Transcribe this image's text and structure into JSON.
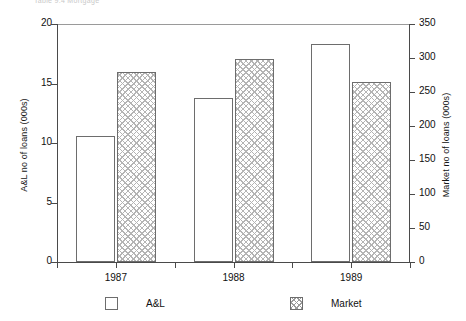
{
  "caption": {
    "text": "Table 9.4  Mortgage"
  },
  "legend": {
    "entries": [
      {
        "label": "A&L",
        "style": "plain"
      },
      {
        "label": "Market",
        "style": "hatched"
      }
    ]
  },
  "axes": {
    "left_title": "A&L no of loans (000s)",
    "right_title": "Market no of loans (000s)",
    "left_ticks": [
      "0",
      "5",
      "10",
      "15",
      "20"
    ],
    "right_ticks": [
      "0",
      "50",
      "100",
      "150",
      "200",
      "250",
      "300",
      "350"
    ]
  },
  "chart_data": {
    "type": "bar",
    "title": "",
    "subtitle": "",
    "xlabel": "",
    "ylabel": "A&L no of loans (000s)",
    "y2label": "Market no of loans (000s)",
    "categories": [
      "1987",
      "1988",
      "1989"
    ],
    "series": [
      {
        "name": "A&L",
        "axis": "left",
        "unit": "000s",
        "values": [
          10.6,
          13.8,
          18.3
        ]
      },
      {
        "name": "Market",
        "axis": "right",
        "unit": "000s",
        "values": [
          265,
          265,
          265
        ]
      }
    ],
    "series_market_left_equivalent": [
      16.0,
      17.1,
      15.1
    ],
    "ylim": [
      0,
      20
    ],
    "y2lim": [
      0,
      350
    ],
    "ytick_step": 5,
    "y2tick_step": 50,
    "grid": false,
    "legend_position": "bottom",
    "colors": {
      "al_fill": "#ffffff",
      "market_fill": "#ffffff",
      "market_hatch": "#b4b4b4",
      "bar_border": "#6d6d6d",
      "axis": "#4a4a4a",
      "text": "#101010"
    }
  }
}
